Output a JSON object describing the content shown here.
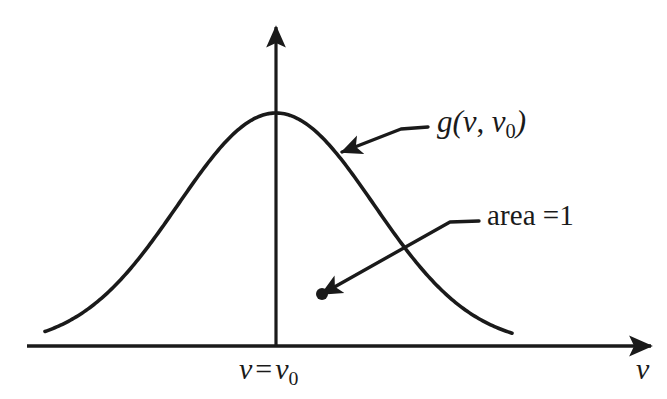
{
  "figure": {
    "background_color": "#ffffff",
    "ink_color": "#1a1a1a",
    "labels": {
      "curve": {
        "full_text": "g(ν, ν₀)",
        "function_name": "g",
        "open_paren": "(",
        "arg1": "ν",
        "comma": ",",
        "arg2": "ν",
        "arg2_subscript": "0",
        "close_paren": ")"
      },
      "area": {
        "full_text": "area =1",
        "word": "area",
        "equals": "=",
        "value": "1"
      },
      "center_tick": {
        "full_text": "ν = ν₀",
        "lhs": "ν",
        "equals": "=",
        "rhs": "ν",
        "rhs_subscript": "0"
      },
      "x_axis_name": "ν",
      "y_axis_name": ""
    }
  },
  "chart_data": {
    "type": "line",
    "title": "",
    "subtitle": "",
    "xlabel": "ν",
    "ylabel": "",
    "grid": false,
    "legend_position": "none",
    "curve_name": "g(ν, ν₀)",
    "curve_shape": "gaussian",
    "peak_x_label": "ν = ν₀",
    "normalization_note": "area =1",
    "axis_ranges": {
      "x_axis_visible_from": 27,
      "x_axis_visible_to": 655,
      "x_axis_baseline_y": 346,
      "y_axis_x": 276,
      "y_axis_top_y": 22
    },
    "peak": {
      "x": 276,
      "y": 113
    },
    "amplitude_px": 233,
    "sigma_px": 98,
    "x_start_px": 45,
    "x_end_px": 512,
    "x": [
      45,
      68,
      91,
      114,
      137,
      160,
      183,
      206,
      229,
      252,
      276,
      299,
      322,
      345,
      368,
      391,
      414,
      437,
      460,
      483,
      512
    ],
    "y": [
      335.1,
      331.3,
      325.1,
      315.6,
      302.0,
      283.9,
      261.5,
      236.0,
      209.3,
      184.8,
      113.0,
      184.8,
      209.3,
      236.0,
      261.5,
      283.9,
      302.0,
      315.6,
      325.1,
      331.3,
      336.0
    ],
    "annotations": [
      {
        "text": "g(ν, ν₀)",
        "kind": "leader-arrow",
        "target_x": 342,
        "target_y": 152,
        "elbow_x": 401,
        "elbow_y": 129,
        "tail_x": 428,
        "tail_y": 127,
        "arrowhead": true,
        "points_at": "curve-right-flank"
      },
      {
        "text": "area =1",
        "kind": "leader-arrow",
        "target_x": 322,
        "target_y": 294,
        "elbow_x": 450,
        "elbow_y": 222,
        "tail_x": 479,
        "tail_y": 221,
        "arrowhead": true,
        "dot": true,
        "dot_radius": 6,
        "points_at": "area-under-curve"
      }
    ]
  }
}
